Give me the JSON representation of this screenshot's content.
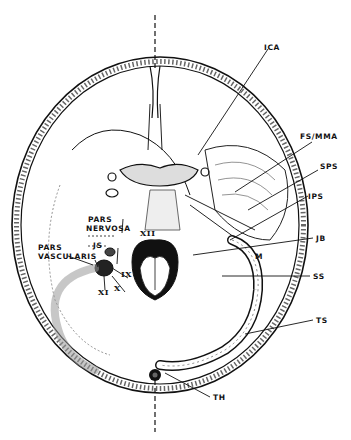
{
  "figure": {
    "labels": {
      "ica": "ICA",
      "fs_mma": "FS/MMA",
      "sps": "SPS",
      "ips": "IPS",
      "jb": "JB",
      "m": "M",
      "ss": "SS",
      "ts": "TS",
      "th": "TH",
      "pars_nervosa_1": "PARS",
      "pars_nervosa_2": "NERVOSA",
      "pars_vascularis_1": "PARS",
      "pars_vascularis_2": "VASCULARIS",
      "js": "JS",
      "xii": "XII",
      "ix": "IX",
      "x": "X",
      "xi": "XI"
    },
    "colors": {
      "ink": "#111111",
      "paper": "#ffffff"
    }
  }
}
